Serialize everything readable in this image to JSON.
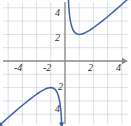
{
  "figure": {
    "background_color": "#ffffff",
    "grid_color": "#ccd3dd",
    "axis_color": "#8a8a8a",
    "curve_color": "#3f5fa8",
    "label_color": "#2b2b2b"
  },
  "chart_data": {
    "type": "line",
    "title": "",
    "xlabel": "",
    "ylabel": "",
    "xlim": [
      -5,
      5
    ],
    "ylim": [
      -5,
      5
    ],
    "grid": true,
    "grid_step": 1,
    "legend": "none",
    "x_tick_labels": [
      "-4",
      "-2",
      "2",
      "4"
    ],
    "x_tick_values": [
      -4,
      -2,
      2,
      4
    ],
    "y_tick_labels": [
      "4",
      "2",
      "2",
      "4"
    ],
    "y_tick_values": [
      4,
      2,
      -2,
      -4
    ],
    "y_tick_display": {
      "upper": [
        "4",
        "2"
      ],
      "lower": [
        "2",
        "4"
      ]
    },
    "asymptote_x": 0,
    "annotations": [
      {
        "label": "minimum",
        "x": 1,
        "y": 2
      },
      {
        "label": "maximum",
        "x": -1,
        "y": -2
      }
    ],
    "series": [
      {
        "name": "right-branch",
        "arrow_start": true,
        "arrow_end": true,
        "points": [
          [
            0.23,
            5.0
          ],
          [
            0.26,
            4.2
          ],
          [
            0.3,
            3.63
          ],
          [
            0.35,
            3.21
          ],
          [
            0.4,
            2.9
          ],
          [
            0.5,
            2.5
          ],
          [
            0.6,
            2.27
          ],
          [
            0.7,
            2.13
          ],
          [
            0.85,
            2.03
          ],
          [
            1.0,
            2.0
          ],
          [
            1.2,
            2.03
          ],
          [
            1.4,
            2.11
          ],
          [
            1.7,
            2.29
          ],
          [
            2.0,
            2.5
          ],
          [
            2.5,
            2.9
          ],
          [
            3.0,
            3.33
          ],
          [
            3.5,
            3.79
          ],
          [
            4.0,
            4.25
          ],
          [
            4.4,
            4.63
          ],
          [
            4.75,
            4.96
          ]
        ]
      },
      {
        "name": "left-branch",
        "arrow_start": true,
        "arrow_end": true,
        "points": [
          [
            -4.75,
            -4.96
          ],
          [
            -4.4,
            -4.63
          ],
          [
            -4.0,
            -4.25
          ],
          [
            -3.5,
            -3.79
          ],
          [
            -3.0,
            -3.33
          ],
          [
            -2.5,
            -2.9
          ],
          [
            -2.0,
            -2.5
          ],
          [
            -1.7,
            -2.29
          ],
          [
            -1.4,
            -2.11
          ],
          [
            -1.2,
            -2.03
          ],
          [
            -1.0,
            -2.0
          ],
          [
            -0.85,
            -2.03
          ],
          [
            -0.7,
            -2.13
          ],
          [
            -0.6,
            -2.27
          ],
          [
            -0.5,
            -2.5
          ],
          [
            -0.4,
            -2.9
          ],
          [
            -0.35,
            -3.21
          ],
          [
            -0.3,
            -3.63
          ],
          [
            -0.26,
            -4.2
          ],
          [
            -0.23,
            -5.0
          ]
        ]
      }
    ]
  },
  "labels": {
    "x_neg4": "-4",
    "x_neg2": "-2",
    "x_pos2": "2",
    "x_pos4": "4",
    "y_pos4": "4",
    "y_pos2": "2",
    "y_neg2": "2",
    "y_neg4": "4"
  }
}
